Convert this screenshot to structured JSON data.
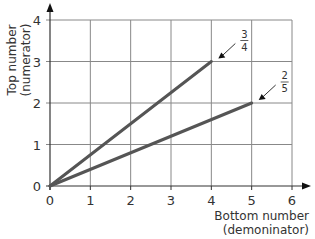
{
  "chart_data": {
    "type": "line",
    "title": "",
    "xlabel": "Bottom number (demoninator)",
    "xlabel_lines": [
      "Bottom number",
      "(demoninator)"
    ],
    "ylabel": "Top number (numerator)",
    "ylabel_lines": [
      "Top number",
      "(numerator)"
    ],
    "xlim": [
      0,
      6
    ],
    "ylim": [
      0,
      4
    ],
    "xticks": [
      0,
      1,
      2,
      3,
      4,
      5,
      6
    ],
    "yticks": [
      0,
      1,
      2,
      3,
      4
    ],
    "grid": true,
    "series": [
      {
        "name": "3/4",
        "label_num": "3",
        "label_den": "4",
        "x": [
          0,
          4
        ],
        "y": [
          0,
          3
        ]
      },
      {
        "name": "2/5",
        "label_num": "2",
        "label_den": "5",
        "x": [
          0,
          5
        ],
        "y": [
          0,
          2
        ]
      }
    ],
    "colors": {
      "line": "#555555",
      "grid": "#888888",
      "axis": "#333333"
    }
  }
}
